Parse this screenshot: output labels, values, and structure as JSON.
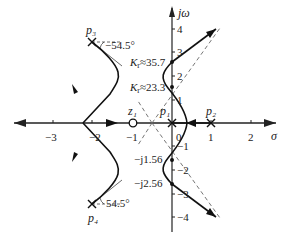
{
  "diagram": {
    "type": "root-locus",
    "axes": {
      "x_label": "σ",
      "y_label": "jω",
      "x_ticks": [
        "−3",
        "−2",
        "−1",
        "0",
        "1",
        "2"
      ],
      "y_ticks_pos": [
        "1",
        "2",
        "3",
        "4"
      ],
      "y_ticks_neg": [
        "−1",
        "−2",
        "−3",
        "−4"
      ]
    },
    "poles": [
      {
        "name": "p1",
        "label": "p₁",
        "position": "0"
      },
      {
        "name": "p2",
        "label": "p₂",
        "position": "1"
      },
      {
        "name": "p3",
        "label": "p₃",
        "position": "−2.2 + j3.5"
      },
      {
        "name": "p4",
        "label": "p₄",
        "position": "−2.2 − j3.5"
      }
    ],
    "zeros": [
      {
        "name": "z1",
        "label": "z₁",
        "position": "−1"
      }
    ],
    "annotations": {
      "angle_p3": "−54.5°",
      "angle_p4": "54.5°",
      "gain_upper": "K_r≈35.7",
      "gain_lower": "K_r≈23.3",
      "crossing_1": "−j1.56",
      "crossing_2": "−j2.56",
      "gain_upper_k": "K",
      "gain_upper_sub": "r",
      "gain_upper_val": "≈35.7",
      "gain_lower_k": "K",
      "gain_lower_sub": "r",
      "gain_lower_val": "≈23.3"
    },
    "colors": {
      "line": "#222222",
      "asymptote": "#666666"
    }
  }
}
